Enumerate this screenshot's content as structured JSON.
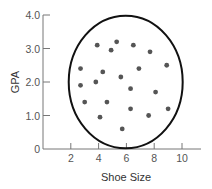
{
  "chart_data": {
    "type": "scatter",
    "title": "",
    "xlabel": "Shoe Size",
    "ylabel": "GPA",
    "xlim": [
      0,
      11.5
    ],
    "ylim": [
      0,
      4.0
    ],
    "x_ticks": [
      2,
      4,
      6,
      8,
      10
    ],
    "x_tick_labels": [
      "2",
      "4",
      "6",
      "8",
      "10"
    ],
    "y_ticks": [
      0,
      1.0,
      2.0,
      3.0,
      4.0
    ],
    "y_tick_labels": [
      "0",
      "1.0",
      "2.0",
      "3.0",
      "4.0"
    ],
    "grid": false,
    "legend": null,
    "series": [
      {
        "name": "Students",
        "color": "#555555",
        "points": [
          {
            "x": 3.9,
            "y": 3.1
          },
          {
            "x": 5.3,
            "y": 3.2
          },
          {
            "x": 4.9,
            "y": 2.95
          },
          {
            "x": 6.5,
            "y": 3.1
          },
          {
            "x": 7.7,
            "y": 2.9
          },
          {
            "x": 2.7,
            "y": 2.4
          },
          {
            "x": 4.3,
            "y": 2.3
          },
          {
            "x": 6.9,
            "y": 2.4
          },
          {
            "x": 8.9,
            "y": 2.5
          },
          {
            "x": 2.7,
            "y": 1.9
          },
          {
            "x": 3.8,
            "y": 2.0
          },
          {
            "x": 5.6,
            "y": 2.15
          },
          {
            "x": 6.3,
            "y": 1.8
          },
          {
            "x": 8.1,
            "y": 1.7
          },
          {
            "x": 3.0,
            "y": 1.4
          },
          {
            "x": 4.6,
            "y": 1.4
          },
          {
            "x": 6.3,
            "y": 1.2
          },
          {
            "x": 9.0,
            "y": 1.2
          },
          {
            "x": 4.1,
            "y": 0.95
          },
          {
            "x": 7.6,
            "y": 1.0
          },
          {
            "x": 5.7,
            "y": 0.6
          }
        ]
      }
    ],
    "annotations": [
      {
        "type": "ellipse",
        "description": "circle enclosing all points (no correlation)",
        "center": {
          "x": 5.95,
          "y": 2.0
        },
        "radius_x": 4.1,
        "radius_y": 1.98,
        "stroke": "#111111"
      }
    ]
  }
}
